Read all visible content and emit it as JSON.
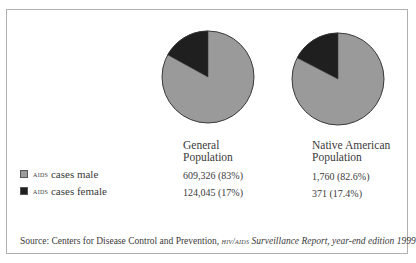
{
  "chart_data": {
    "type": "pie",
    "title": "",
    "categories": [
      "AIDS cases male",
      "AIDS cases female"
    ],
    "colors": {
      "male": "#9a9a9a",
      "female": "#1f1f1f",
      "outline": "#3a3a3a"
    },
    "series": [
      {
        "name": "General Population",
        "values": [
          609326,
          124045
        ],
        "percentages": [
          83,
          17
        ],
        "labels": [
          "609,326 (83%)",
          "124,045 (17%)"
        ]
      },
      {
        "name": "Native American Population",
        "values": [
          1760,
          371
        ],
        "percentages": [
          82.6,
          17.4
        ],
        "labels": [
          "1,760 (82.6%)",
          "371 (17.4%)"
        ]
      }
    ],
    "legend_position": "left",
    "source": "Source: Centers for Disease Control and Prevention, HIV/AIDS Surveillance Report, year-end edition 1999"
  },
  "columns": [
    {
      "header_line1": "General",
      "header_line2": "Population",
      "male": "609,326 (83%)",
      "female": "124,045 (17%)",
      "female_pct": 17
    },
    {
      "header_line1": "Native American",
      "header_line2": "Population",
      "male": "1,760 (82.6%)",
      "female": "371 (17.4%)",
      "female_pct": 17.4
    }
  ],
  "legend": [
    {
      "prefix": "AIDS",
      "label": " cases male",
      "color": "#9a9a9a"
    },
    {
      "prefix": "AIDS",
      "label": " cases female",
      "color": "#1f1f1f"
    }
  ],
  "source": {
    "lead": "Source: Centers for Disease Control and Prevention, ",
    "org": "HIV/AIDS",
    "title": " Surveillance Report, year-end edition ",
    "year": "1999"
  }
}
